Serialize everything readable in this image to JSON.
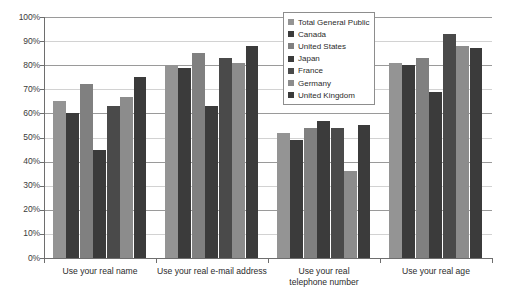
{
  "chart_data": {
    "type": "bar",
    "title": "",
    "subtitle": "",
    "xlabel": "",
    "ylabel": "",
    "ylim": [
      0,
      100
    ],
    "ytick_labels": [
      "100%",
      "90%",
      "80%",
      "70%",
      "60%",
      "50%",
      "40%",
      "30%",
      "20%",
      "10%",
      "0%"
    ],
    "ytick_values": [
      100,
      90,
      80,
      70,
      60,
      50,
      40,
      30,
      20,
      10,
      0
    ],
    "grid": true,
    "grid_axis": "y",
    "legend_position": "top-right",
    "categories": [
      "Use your real name",
      "Use your real e-mail address",
      "Use your real telephone number",
      "Use your real age"
    ],
    "category_lines": [
      [
        "Use your real name"
      ],
      [
        "Use your real e-mail address"
      ],
      [
        "Use your real",
        "telephone number"
      ],
      [
        "Use your real age"
      ]
    ],
    "series": [
      {
        "name": "Total General Public",
        "color": "#949494",
        "values": [
          65,
          80,
          52,
          81
        ]
      },
      {
        "name": "Canada",
        "color": "#3b3b3b",
        "values": [
          60,
          79,
          49,
          80
        ]
      },
      {
        "name": "United States",
        "color": "#808080",
        "values": [
          72,
          85,
          54,
          83
        ]
      },
      {
        "name": "Japan",
        "color": "#3b3b3b",
        "values": [
          45,
          63,
          57,
          69
        ]
      },
      {
        "name": "France",
        "color": "#4a4a4a",
        "values": [
          63,
          83,
          54,
          93
        ]
      },
      {
        "name": "Germany",
        "color": "#8c8c8c",
        "values": [
          67,
          81,
          36,
          88
        ]
      },
      {
        "name": "United Kingdom",
        "color": "#3b3b3b",
        "values": [
          75,
          88,
          55,
          87
        ]
      }
    ]
  }
}
